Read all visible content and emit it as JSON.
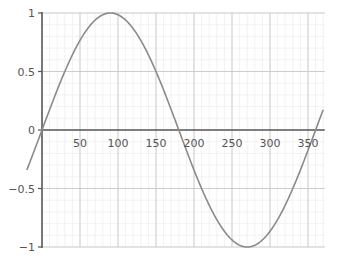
{
  "chart_data": {
    "type": "line",
    "title": "",
    "xlabel": "",
    "ylabel": "",
    "function": "y = sin(x)",
    "xlim": [
      0,
      372
    ],
    "ylim": [
      -1,
      1
    ],
    "x_ticks": [
      50,
      100,
      150,
      200,
      250,
      300,
      350
    ],
    "x_tick_labels": [
      "50",
      "100",
      "150",
      "200",
      "250",
      "300",
      "350"
    ],
    "y_ticks": [
      1,
      0.5,
      0,
      -0.5,
      -1
    ],
    "y_tick_labels": [
      "1",
      "0.5",
      "0",
      "−0.5",
      "−1"
    ],
    "grid": true,
    "series": [
      {
        "name": "sin x",
        "color": "#8a8a8a",
        "x": [
          -20,
          0,
          30,
          60,
          90,
          120,
          150,
          180,
          210,
          240,
          270,
          300,
          330,
          360,
          370
        ],
        "values": [
          -0.34,
          0,
          0.5,
          0.866,
          1,
          0.866,
          0.5,
          0,
          -0.5,
          -0.866,
          -1,
          -0.866,
          -0.5,
          0,
          0.17
        ]
      }
    ]
  },
  "colors": {
    "axis": "#555555",
    "major_grid": "#c8c8c8",
    "minor_grid": "#ececec",
    "curve": "#8a8a8a"
  }
}
